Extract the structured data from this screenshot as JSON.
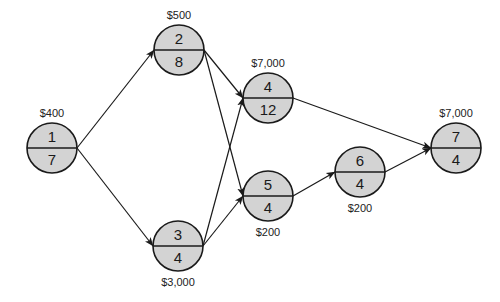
{
  "diagram": {
    "type": "activity-on-node network",
    "colors": {
      "node_fill": "#d3d3d3",
      "stroke": "#1a1a1a",
      "background": "#ffffff"
    },
    "nodes": [
      {
        "id": "1",
        "activity": "1",
        "duration": "7",
        "cost": "$400",
        "cx": 52,
        "cy": 148,
        "cost_pos": "above"
      },
      {
        "id": "2",
        "activity": "2",
        "duration": "8",
        "cost": "$500",
        "cx": 179,
        "cy": 50,
        "cost_pos": "above"
      },
      {
        "id": "3",
        "activity": "3",
        "duration": "4",
        "cost": "$3,000",
        "cx": 178,
        "cy": 246,
        "cost_pos": "below"
      },
      {
        "id": "4",
        "activity": "4",
        "duration": "12",
        "cost": "$7,000",
        "cx": 268,
        "cy": 98,
        "cost_pos": "above"
      },
      {
        "id": "5",
        "activity": "5",
        "duration": "4",
        "cost": "$200",
        "cx": 268,
        "cy": 196,
        "cost_pos": "below"
      },
      {
        "id": "6",
        "activity": "6",
        "duration": "4",
        "cost": "$200",
        "cx": 360,
        "cy": 172,
        "cost_pos": "below"
      },
      {
        "id": "7",
        "activity": "7",
        "duration": "4",
        "cost": "$7,000",
        "cx": 456,
        "cy": 148,
        "cost_pos": "above"
      }
    ],
    "edges": [
      {
        "from": "1",
        "to": "2"
      },
      {
        "from": "1",
        "to": "3"
      },
      {
        "from": "2",
        "to": "4"
      },
      {
        "from": "2",
        "to": "5"
      },
      {
        "from": "3",
        "to": "4"
      },
      {
        "from": "3",
        "to": "5"
      },
      {
        "from": "4",
        "to": "7"
      },
      {
        "from": "5",
        "to": "6"
      },
      {
        "from": "6",
        "to": "7"
      }
    ]
  }
}
